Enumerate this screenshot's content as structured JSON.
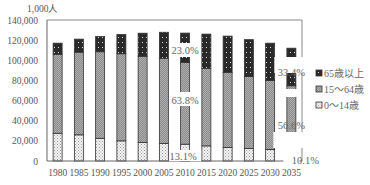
{
  "chart_data": {
    "type": "bar",
    "stacked": true,
    "title": "",
    "unit_label": "1,000人",
    "xlabel": "",
    "ylabel": "1,000人",
    "ylim": [
      0,
      140000
    ],
    "yticks": [
      0,
      20000,
      40000,
      60000,
      80000,
      100000,
      120000,
      140000
    ],
    "ytick_labels": [
      "0",
      "20,000",
      "40,000",
      "60,000",
      "80,000",
      "100,000",
      "120,000",
      "140,000"
    ],
    "categories": [
      "1980",
      "1985",
      "1990",
      "1995",
      "2000",
      "2005",
      "2010",
      "2015",
      "2020",
      "2025",
      "2030",
      "2035"
    ],
    "series": [
      {
        "name": "0～14歳",
        "pattern": "dots-light",
        "values": [
          27500,
          26000,
          22500,
          20000,
          18500,
          17500,
          16700,
          15000,
          13500,
          12500,
          11500,
          11300
        ]
      },
      {
        "name": "15～64歳",
        "pattern": "gray-hatch",
        "values": [
          78500,
          82000,
          86000,
          86500,
          85500,
          84500,
          81000,
          77000,
          74500,
          71500,
          68500,
          63400
        ]
      },
      {
        "name": "65歳以上",
        "pattern": "dark-dots",
        "values": [
          11000,
          13000,
          15100,
          19100,
          22900,
          25800,
          29300,
          34000,
          36000,
          36500,
          37000,
          37300
        ]
      }
    ],
    "annotations": [
      {
        "category": "2010",
        "series": "65歳以上",
        "text": "23.0%"
      },
      {
        "category": "2010",
        "series": "15～64歳",
        "text": "63.8%"
      },
      {
        "category": "2010",
        "series": "0～14歳",
        "text": "13.1%"
      },
      {
        "category": "2035",
        "series": "65歳以上",
        "text": "33.4%"
      },
      {
        "category": "2035",
        "series": "15～64歳",
        "text": "56.6%"
      },
      {
        "category": "2035",
        "series": "0～14歳",
        "text": "10.1%"
      }
    ],
    "legend": {
      "position": "right",
      "entries": [
        "65歳以上",
        "15～64歳",
        "0～14歳"
      ]
    },
    "grid": false
  }
}
